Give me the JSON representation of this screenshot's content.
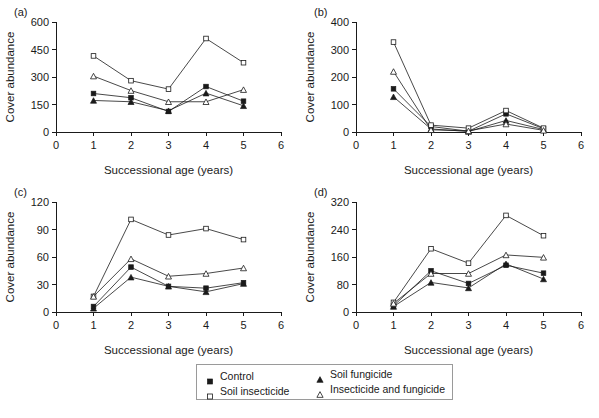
{
  "figure": {
    "background_color": "#ffffff",
    "ink_color": "#1a1a1a",
    "x_axis_title": "Successional age (years)",
    "y_axis_title": "Cover abundance",
    "x_ticks": [
      "0",
      "1",
      "2",
      "3",
      "4",
      "5",
      "6"
    ]
  },
  "legend": {
    "entries": [
      {
        "label": "Control",
        "marker": "filled-square"
      },
      {
        "label": "Soil fungicide",
        "marker": "filled-triangle"
      },
      {
        "label": "Soil insecticide",
        "marker": "open-square"
      },
      {
        "label": "Insecticide and fungicide",
        "marker": "open-triangle"
      }
    ]
  },
  "panels": {
    "a": {
      "label": "(a)",
      "y_ticks": [
        "0",
        "150",
        "300",
        "450",
        "600"
      ]
    },
    "b": {
      "label": "(b)",
      "y_ticks": [
        "0",
        "100",
        "200",
        "300",
        "400"
      ]
    },
    "c": {
      "label": "(c)",
      "y_ticks": [
        "0",
        "30",
        "60",
        "90",
        "120"
      ]
    },
    "d": {
      "label": "(d)",
      "y_ticks": [
        "0",
        "80",
        "160",
        "240",
        "320"
      ]
    }
  },
  "chart_data": [
    {
      "panel": "a",
      "type": "line",
      "title": "(a)",
      "xlabel": "Successional age (years)",
      "ylabel": "Cover abundance",
      "x": [
        1,
        2,
        3,
        4,
        5
      ],
      "xlim": [
        0,
        6
      ],
      "ylim": [
        0,
        600
      ],
      "yticks": [
        0,
        150,
        300,
        450,
        600
      ],
      "xticks": [
        0,
        1,
        2,
        3,
        4,
        5,
        6
      ],
      "grid": false,
      "legend_position": "below-figure",
      "series": [
        {
          "name": "Control",
          "marker": "filled-square",
          "values": [
            210,
            187,
            112,
            248,
            168
          ]
        },
        {
          "name": "Soil fungicide",
          "marker": "filled-triangle",
          "values": [
            172,
            165,
            116,
            212,
            143
          ]
        },
        {
          "name": "Soil insecticide",
          "marker": "open-square",
          "values": [
            415,
            280,
            234,
            510,
            378
          ]
        },
        {
          "name": "Insecticide and fungicide",
          "marker": "open-triangle",
          "values": [
            305,
            226,
            165,
            165,
            231
          ]
        }
      ]
    },
    {
      "panel": "b",
      "type": "line",
      "title": "(b)",
      "xlabel": "Successional age (years)",
      "ylabel": "Cover abundance",
      "x": [
        1,
        2,
        3,
        4,
        5
      ],
      "xlim": [
        0,
        6
      ],
      "ylim": [
        0,
        400
      ],
      "yticks": [
        0,
        100,
        200,
        300,
        400
      ],
      "xticks": [
        0,
        1,
        2,
        3,
        4,
        5,
        6
      ],
      "grid": false,
      "legend_position": "below-figure",
      "series": [
        {
          "name": "Control",
          "marker": "filled-square",
          "values": [
            157,
            20,
            3,
            66,
            12
          ]
        },
        {
          "name": "Soil fungicide",
          "marker": "filled-triangle",
          "values": [
            128,
            11,
            2,
            42,
            9
          ]
        },
        {
          "name": "Soil insecticide",
          "marker": "open-square",
          "values": [
            327,
            25,
            14,
            78,
            14
          ]
        },
        {
          "name": "Insecticide and fungicide",
          "marker": "open-triangle",
          "values": [
            220,
            8,
            4,
            29,
            6
          ]
        }
      ]
    },
    {
      "panel": "c",
      "type": "line",
      "title": "(c)",
      "xlabel": "Successional age (years)",
      "ylabel": "Cover abundance",
      "x": [
        1,
        2,
        3,
        4,
        5
      ],
      "xlim": [
        0,
        6
      ],
      "ylim": [
        0,
        120
      ],
      "yticks": [
        0,
        30,
        60,
        90,
        120
      ],
      "xticks": [
        0,
        1,
        2,
        3,
        4,
        5,
        6
      ],
      "grid": false,
      "legend_position": "below-figure",
      "series": [
        {
          "name": "Control",
          "marker": "filled-square",
          "values": [
            6,
            49,
            28,
            26,
            32
          ]
        },
        {
          "name": "Soil fungicide",
          "marker": "filled-triangle",
          "values": [
            4,
            38,
            28,
            22,
            31
          ]
        },
        {
          "name": "Soil insecticide",
          "marker": "open-square",
          "values": [
            17,
            101,
            84,
            91,
            79
          ]
        },
        {
          "name": "Insecticide and fungicide",
          "marker": "open-triangle",
          "values": [
            17,
            58,
            39,
            42,
            48
          ]
        }
      ]
    },
    {
      "panel": "d",
      "type": "line",
      "title": "(d)",
      "xlabel": "Successional age (years)",
      "ylabel": "Cover abundance",
      "x": [
        1,
        2,
        3,
        4,
        5
      ],
      "xlim": [
        0,
        6
      ],
      "ylim": [
        0,
        320
      ],
      "yticks": [
        0,
        80,
        160,
        240,
        320
      ],
      "xticks": [
        0,
        1,
        2,
        3,
        4,
        5,
        6
      ],
      "grid": false,
      "legend_position": "below-figure",
      "series": [
        {
          "name": "Control",
          "marker": "filled-square",
          "values": [
            18,
            120,
            83,
            136,
            113
          ]
        },
        {
          "name": "Soil fungicide",
          "marker": "filled-triangle",
          "values": [
            16,
            86,
            70,
            140,
            96
          ]
        },
        {
          "name": "Soil insecticide",
          "marker": "open-square",
          "values": [
            28,
            184,
            142,
            281,
            222
          ]
        },
        {
          "name": "Insecticide and fungicide",
          "marker": "open-triangle",
          "values": [
            25,
            112,
            112,
            166,
            159
          ]
        }
      ]
    }
  ]
}
